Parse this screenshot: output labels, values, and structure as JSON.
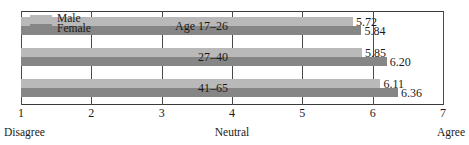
{
  "chart_data": {
    "type": "bar",
    "orientation": "horizontal",
    "title": "",
    "xlabel": "",
    "ylabel": "",
    "xlim": [
      1,
      7
    ],
    "grid": true,
    "grid_axis": "x",
    "legend_position": "top-left",
    "categories": [
      "Age 17–26",
      "27–40",
      "41–65"
    ],
    "tick_labels": [
      "1",
      "2",
      "3",
      "4",
      "5",
      "6",
      "7"
    ],
    "tick_values": [
      1,
      2,
      3,
      4,
      5,
      6,
      7
    ],
    "scale_anchors": {
      "low": "Disagree",
      "mid": "Neutral",
      "high": "Agree"
    },
    "series": [
      {
        "name": "Male",
        "color": "#b9b9b9",
        "values": [
          5.72,
          5.85,
          6.11
        ],
        "value_labels": [
          "5.72",
          "5.85",
          "6.11"
        ]
      },
      {
        "name": "Female",
        "color": "#868686",
        "values": [
          5.84,
          6.2,
          6.36
        ],
        "value_labels": [
          "5.84",
          "6.20",
          "6.36"
        ]
      }
    ]
  },
  "legend": {
    "male_label": "Male",
    "female_label": "Female"
  }
}
